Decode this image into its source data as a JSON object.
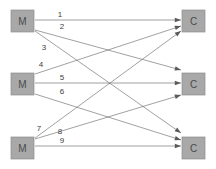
{
  "diagram": {
    "type": "bipartite-assignment-graph",
    "background_color": "#ffffff",
    "node_fill_color": "#a8a8a8",
    "node_stroke_color": "#8e8e8e",
    "node_text_color": "#4a4a4a",
    "edge_color": "#6e6e6e",
    "arrowhead_color": "#5a5a5a",
    "label_text_color": "#3d3d3d",
    "left_nodes": [
      {
        "id": "m1",
        "label": "M",
        "x": 11,
        "y": 10,
        "w": 23,
        "h": 22
      },
      {
        "id": "m2",
        "label": "M",
        "x": 11,
        "y": 73,
        "w": 23,
        "h": 22
      },
      {
        "id": "m3",
        "label": "M",
        "x": 11,
        "y": 137,
        "w": 23,
        "h": 22
      }
    ],
    "right_nodes": [
      {
        "id": "c1",
        "label": "C",
        "x": 182,
        "y": 10,
        "w": 23,
        "h": 22
      },
      {
        "id": "c2",
        "label": "C",
        "x": 182,
        "y": 73,
        "w": 23,
        "h": 22
      },
      {
        "id": "c3",
        "label": "C",
        "x": 182,
        "y": 137,
        "w": 23,
        "h": 22
      }
    ],
    "edges": [
      {
        "id": "e1",
        "label": "1",
        "from": "m1",
        "to": "c1",
        "x1": 35,
        "y1": 20,
        "x2": 181,
        "y2": 20,
        "lx": 60,
        "ly": 17
      },
      {
        "id": "e2",
        "label": "2",
        "from": "m1",
        "to": "c2",
        "x1": 35,
        "y1": 30,
        "x2": 181,
        "y2": 70,
        "lx": 62,
        "ly": 29
      },
      {
        "id": "e3",
        "label": "3",
        "from": "m1",
        "to": "c3",
        "x1": 35,
        "y1": 31,
        "x2": 181,
        "y2": 133,
        "lx": 44,
        "ly": 50
      },
      {
        "id": "e4",
        "label": "4",
        "from": "m2",
        "to": "c1",
        "x1": 35,
        "y1": 74,
        "x2": 181,
        "y2": 26,
        "lx": 41,
        "ly": 67
      },
      {
        "id": "e5",
        "label": "5",
        "from": "m2",
        "to": "c2",
        "x1": 35,
        "y1": 83,
        "x2": 181,
        "y2": 83,
        "lx": 62,
        "ly": 80
      },
      {
        "id": "e6",
        "label": "6",
        "from": "m2",
        "to": "c3",
        "x1": 35,
        "y1": 94,
        "x2": 181,
        "y2": 140,
        "lx": 62,
        "ly": 94
      },
      {
        "id": "e7",
        "label": "7",
        "from": "m3",
        "to": "c1",
        "x1": 35,
        "y1": 138,
        "x2": 181,
        "y2": 31,
        "lx": 39,
        "ly": 131
      },
      {
        "id": "e8",
        "label": "8",
        "from": "m3",
        "to": "c2",
        "x1": 35,
        "y1": 139,
        "x2": 181,
        "y2": 95,
        "lx": 60,
        "ly": 134
      },
      {
        "id": "e9",
        "label": "9",
        "from": "m3",
        "to": "c3",
        "x1": 35,
        "y1": 146,
        "x2": 181,
        "y2": 146,
        "lx": 62,
        "ly": 143
      }
    ]
  }
}
